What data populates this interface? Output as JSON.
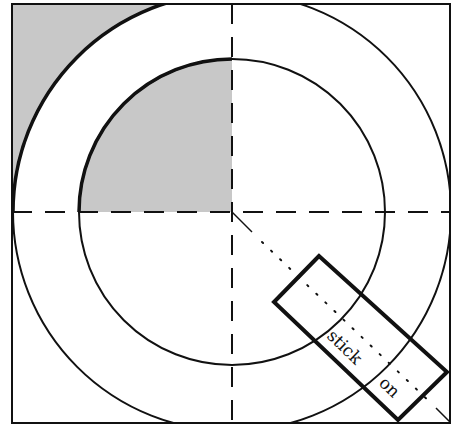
{
  "diagram": {
    "type": "circular ring template with shaded quadrant and label strip",
    "colors": {
      "background": "#ffffff",
      "stroke": "#111111",
      "shade": "#c8c8c8"
    },
    "frame": {
      "x": 12,
      "y": 4,
      "width": 438,
      "height": 419
    },
    "center": {
      "x": 232,
      "y": 212
    },
    "outer_radius": 219,
    "inner_radius": 153,
    "strip": {
      "labels": [
        "stick",
        "on"
      ]
    }
  }
}
